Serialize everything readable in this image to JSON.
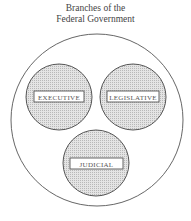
{
  "title": {
    "line1": "Branches of the",
    "line2": "Federal Government"
  },
  "branches": [
    {
      "label": "EXECUTIVE"
    },
    {
      "label": "LEGISLATIVE"
    },
    {
      "label": "JUDICIAL"
    }
  ],
  "colors": {
    "outline": "#555555",
    "fill": "#d6d6d6",
    "label_bg": "#ffffff"
  }
}
